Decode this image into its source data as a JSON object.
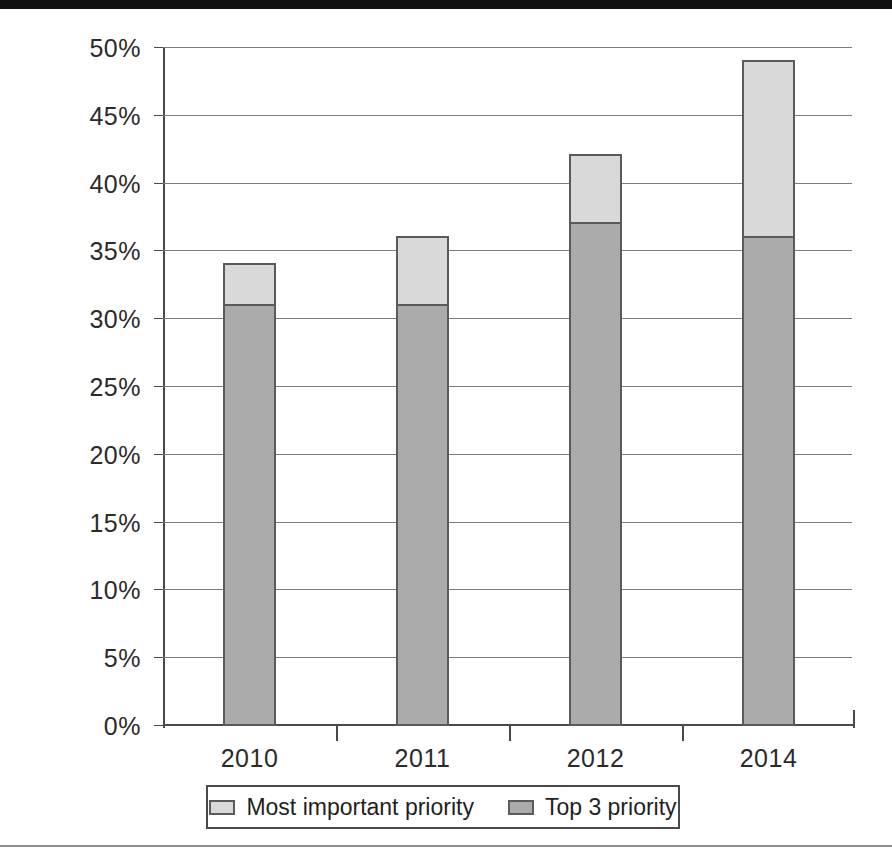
{
  "chart_data": {
    "type": "bar",
    "subtype": "stacked-bar",
    "title": "",
    "subtitle": "",
    "xlabel": "",
    "ylabel": "",
    "categories": [
      "2010",
      "2011",
      "2012",
      "2014"
    ],
    "series": [
      {
        "name": "Top 3 priority",
        "color": "#ababab",
        "values": [
          31,
          31,
          37,
          36
        ],
        "stack_order": "bottom"
      },
      {
        "name": "Most important priority",
        "color": "#d9d9d9",
        "values": [
          3,
          5,
          5,
          13
        ],
        "stack_order": "top"
      }
    ],
    "stack_totals": [
      34,
      36,
      42,
      49
    ],
    "ylim": [
      0,
      50
    ],
    "ytick_step": 5,
    "ytick_labels": [
      "0%",
      "5%",
      "10%",
      "15%",
      "20%",
      "25%",
      "30%",
      "35%",
      "40%",
      "45%",
      "50%"
    ],
    "ytick_values": [
      0,
      5,
      10,
      15,
      20,
      25,
      30,
      35,
      40,
      45,
      50
    ],
    "value_unit": "%",
    "grid": "horizontal",
    "legend_position": "bottom",
    "legend_order": [
      "Most important priority",
      "Top 3 priority"
    ]
  },
  "legend": {
    "items": [
      {
        "label": "Most important priority",
        "color": "#d9d9d9",
        "swatch_name": "legend-swatch-most-important-priority"
      },
      {
        "label": "Top 3 priority",
        "color": "#ababab",
        "swatch_name": "legend-swatch-top-3-priority"
      }
    ]
  },
  "axes": {
    "y": {
      "ticks": [
        {
          "label": "50%",
          "value": 50
        },
        {
          "label": "45%",
          "value": 45
        },
        {
          "label": "40%",
          "value": 40
        },
        {
          "label": "35%",
          "value": 35
        },
        {
          "label": "30%",
          "value": 30
        },
        {
          "label": "25%",
          "value": 25
        },
        {
          "label": "20%",
          "value": 20
        },
        {
          "label": "15%",
          "value": 15
        },
        {
          "label": "10%",
          "value": 10
        },
        {
          "label": "5%",
          "value": 5
        },
        {
          "label": "0%",
          "value": 0
        }
      ]
    },
    "x": {
      "ticks": [
        {
          "label": "2010"
        },
        {
          "label": "2011"
        },
        {
          "label": "2012"
        },
        {
          "label": "2014"
        }
      ]
    }
  },
  "colors": {
    "grid": "#7d7d7d",
    "axis": "#4a4a4a",
    "bar_outline": "#5a5a5a",
    "most_important_priority": "#d9d9d9",
    "top_3_priority": "#ababab",
    "text": "#2b2b2b",
    "scan_band": "#111111"
  }
}
